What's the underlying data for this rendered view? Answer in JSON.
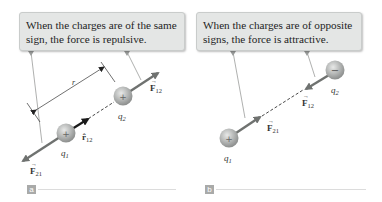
{
  "panels": [
    {
      "id": "a",
      "tag": "a",
      "callout": "When the charges are of the same sign, the force is repulsive.",
      "charges": [
        {
          "name": "q1",
          "label": "q1",
          "sign": "+"
        },
        {
          "name": "q2",
          "label": "q2",
          "sign": "+"
        }
      ],
      "vectors": [
        {
          "name": "F12",
          "label": "F12"
        },
        {
          "name": "F21",
          "label": "F21"
        },
        {
          "name": "r12_hat",
          "label": "r̂12"
        }
      ],
      "distance_label": "r"
    },
    {
      "id": "b",
      "tag": "b",
      "callout": "When the charges are of opposite signs, the force is attractive.",
      "charges": [
        {
          "name": "q1",
          "label": "q1",
          "sign": "+"
        },
        {
          "name": "q2",
          "label": "q2",
          "sign": "−"
        }
      ],
      "vectors": [
        {
          "name": "F12",
          "label": "F12"
        },
        {
          "name": "F21",
          "label": "F21"
        }
      ]
    }
  ],
  "colors": {
    "callout_bg": "#e4e6e5",
    "force_arrow": "#6f7270",
    "unit_vector": "#222222",
    "charge_sphere": "#b4b6b5",
    "tag_bg": "#a9aaa9"
  }
}
